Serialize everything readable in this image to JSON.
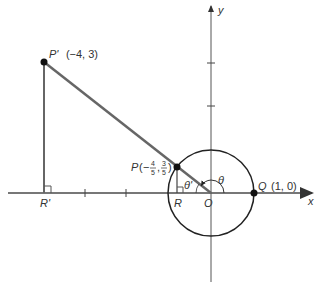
{
  "diagram": {
    "axes": {
      "x_label": "x",
      "y_label": "y"
    },
    "points": {
      "P_prime": {
        "name": "P'",
        "coords": "(−4, 3)"
      },
      "P": {
        "name": "P",
        "x_num": "4",
        "x_den": "5",
        "y_num": "3",
        "y_den": "5",
        "x_sign": "−"
      },
      "Q": {
        "name": "Q",
        "coords": "(1, 0)"
      },
      "R": {
        "name": "R"
      },
      "R_prime": {
        "name": "R'"
      },
      "O": {
        "name": "O"
      }
    },
    "angles": {
      "theta": "θ",
      "theta_ref": "θ'"
    },
    "colors": {
      "axis": "#777777",
      "hypotenuse": "#666666",
      "circle": "#222222",
      "point": "#111111",
      "text": "#333333"
    }
  }
}
